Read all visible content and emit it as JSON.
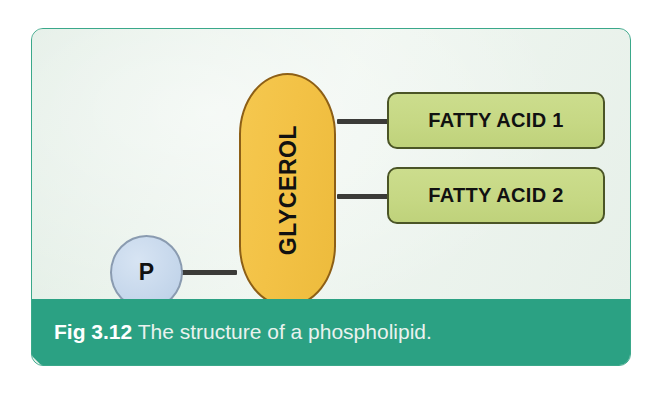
{
  "figure": {
    "card_background": "#eef5ef",
    "card_border_color": "#3aa88a",
    "caption": {
      "figure_number": "Fig 3.12",
      "description": " The structure of a phospholipid.",
      "bar_color": "#2ba183",
      "text_color": "#ffffff"
    },
    "diagram": {
      "type": "molecular-structure-schematic",
      "title": "The structure of a phospholipid",
      "nodes": [
        {
          "id": "phosphate",
          "label": "P",
          "shape": "circle",
          "fill": "#c3d5ea",
          "border": "#8a9bb0",
          "role": "phosphate-group"
        },
        {
          "id": "glycerol",
          "label": "GLYCEROL",
          "shape": "capsule",
          "orientation": "vertical",
          "text_rotation": "-90deg",
          "fill": "#f3c246",
          "border": "#8d5f16",
          "role": "glycerol-backbone"
        },
        {
          "id": "fatty-acid-1",
          "label": "FATTY ACID 1",
          "shape": "rounded-rect",
          "fill": "#c6d884",
          "border": "#4b5526",
          "role": "fatty-acid-tail"
        },
        {
          "id": "fatty-acid-2",
          "label": "FATTY ACID 2",
          "shape": "rounded-rect",
          "fill": "#c6d884",
          "border": "#4b5526",
          "role": "fatty-acid-tail"
        }
      ],
      "connectors": [
        {
          "id": "bond-phosphate-glycerol",
          "from": "phosphate",
          "to": "glycerol",
          "color": "#3b3b38"
        },
        {
          "id": "bond-glycerol-fatty-acid-1",
          "from": "glycerol",
          "to": "fatty-acid-1",
          "color": "#3b3b38"
        },
        {
          "id": "bond-glycerol-fatty-acid-2",
          "from": "glycerol",
          "to": "fatty-acid-2",
          "color": "#3b3b38"
        }
      ]
    }
  }
}
